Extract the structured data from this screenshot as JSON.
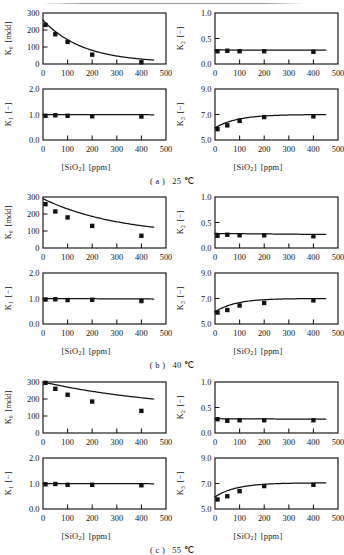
{
  "figure": {
    "xlabel_main": "[SiO",
    "xlabel_sub": "2",
    "xlabel_close": "]",
    "xlabel_unit": "[ppm]",
    "x_ticks": [
      "0",
      "100",
      "200",
      "300",
      "400",
      "500"
    ],
    "xlim": [
      0,
      500
    ],
    "marker_color": "#121212",
    "curve_color": "#121212",
    "axis_color": "#141414"
  },
  "sections": [
    {
      "id": "a",
      "caption_label": "( a )",
      "caption_value": "25 ℃",
      "panels": [
        {
          "position": "top-left",
          "y_symbol": "K",
          "y_subscript": "0",
          "y_unit": "[mdd]",
          "y_ticks": [
            "0",
            "100",
            "200",
            "300"
          ],
          "ylim": [
            0,
            300
          ],
          "points_x": [
            10,
            50,
            100,
            200,
            400
          ],
          "points_y": [
            230,
            175,
            130,
            55,
            10
          ],
          "curve_type": "exponential-decay",
          "curve_y0": 258,
          "curve_y_end": 8,
          "curve_k": 0.0062
        },
        {
          "position": "top-right",
          "y_symbol": "K",
          "y_subscript": "2",
          "y_unit": "[−]",
          "y_ticks": [
            "0.0",
            "0.5",
            "1.0"
          ],
          "ylim": [
            0,
            1
          ],
          "points_x": [
            10,
            50,
            100,
            200,
            400
          ],
          "points_y": [
            0.25,
            0.26,
            0.25,
            0.25,
            0.24
          ],
          "curve_type": "flat",
          "curve_y0": 0.275,
          "curve_y_end": 0.27,
          "curve_k": 0
        },
        {
          "position": "bottom-left",
          "y_symbol": "K",
          "y_subscript": "1",
          "y_unit": "[−]",
          "y_ticks": [
            "0.0",
            "1.0",
            "2.0"
          ],
          "ylim": [
            0,
            2
          ],
          "points_x": [
            10,
            50,
            100,
            200,
            400
          ],
          "points_y": [
            0.95,
            0.97,
            0.95,
            0.93,
            0.92
          ],
          "curve_type": "flat",
          "curve_y0": 1.0,
          "curve_y_end": 0.99,
          "curve_k": 0
        },
        {
          "position": "bottom-right",
          "y_symbol": "K",
          "y_subscript": "3",
          "y_unit": "[−]",
          "y_ticks": [
            "5.0",
            "7.0",
            "9.0"
          ],
          "ylim": [
            5,
            9
          ],
          "points_x": [
            10,
            50,
            100,
            200,
            400
          ],
          "points_y": [
            5.85,
            6.15,
            6.5,
            6.8,
            6.85
          ],
          "curve_type": "saturating-rise",
          "curve_y0": 5.95,
          "curve_y_end": 7.0,
          "curve_k": 0.011
        }
      ]
    },
    {
      "id": "b",
      "caption_label": "( b )",
      "caption_value": "40 ℃",
      "panels": [
        {
          "position": "top-left",
          "y_symbol": "K",
          "y_subscript": "0",
          "y_unit": "[mdd]",
          "y_ticks": [
            "0",
            "100",
            "200",
            "300"
          ],
          "ylim": [
            0,
            300
          ],
          "points_x": [
            10,
            50,
            100,
            200,
            400
          ],
          "points_y": [
            258,
            215,
            180,
            130,
            72
          ],
          "curve_type": "exponential-decay",
          "curve_y0": 290,
          "curve_y_end": 70,
          "curve_k": 0.0032
        },
        {
          "position": "top-right",
          "y_symbol": "K",
          "y_subscript": "2",
          "y_unit": "[−]",
          "y_ticks": [
            "0.0",
            "0.5",
            "1.0"
          ],
          "ylim": [
            0,
            1
          ],
          "points_x": [
            10,
            50,
            100,
            200,
            400
          ],
          "points_y": [
            0.24,
            0.26,
            0.25,
            0.25,
            0.23
          ],
          "curve_type": "flat",
          "curve_y0": 0.285,
          "curve_y_end": 0.265,
          "curve_k": 0
        },
        {
          "position": "bottom-left",
          "y_symbol": "K",
          "y_subscript": "1",
          "y_unit": "[−]",
          "y_ticks": [
            "0.0",
            "1.0",
            "2.0"
          ],
          "ylim": [
            0,
            2
          ],
          "points_x": [
            10,
            50,
            100,
            200,
            400
          ],
          "points_y": [
            0.96,
            0.97,
            0.94,
            0.95,
            0.9
          ],
          "curve_type": "flat",
          "curve_y0": 1.0,
          "curve_y_end": 0.98,
          "curve_k": 0
        },
        {
          "position": "bottom-right",
          "y_symbol": "K",
          "y_subscript": "3",
          "y_unit": "[−]",
          "y_ticks": [
            "5.0",
            "7.0",
            "9.0"
          ],
          "ylim": [
            5,
            9
          ],
          "points_x": [
            10,
            50,
            100,
            200,
            400
          ],
          "points_y": [
            5.9,
            6.1,
            6.45,
            6.65,
            6.85
          ],
          "curve_type": "saturating-rise",
          "curve_y0": 5.95,
          "curve_y_end": 7.0,
          "curve_k": 0.012
        }
      ]
    },
    {
      "id": "c",
      "caption_label": "( c )",
      "caption_value": "55 ℃",
      "panels": [
        {
          "position": "top-left",
          "y_symbol": "K",
          "y_subscript": "0",
          "y_unit": "[mdd]",
          "y_ticks": [
            "0",
            "100",
            "200",
            "300"
          ],
          "ylim": [
            0,
            300
          ],
          "points_x": [
            10,
            50,
            100,
            200,
            400
          ],
          "points_y": [
            295,
            260,
            225,
            185,
            130
          ],
          "curve_type": "exponential-decay",
          "curve_y0": 300,
          "curve_y_end": 126,
          "curve_k": 0.0019
        },
        {
          "position": "top-right",
          "y_symbol": "K",
          "y_subscript": "2",
          "y_unit": "[−]",
          "y_ticks": [
            "0.0",
            "0.5",
            "1.0"
          ],
          "ylim": [
            0,
            1
          ],
          "points_x": [
            10,
            50,
            100,
            200,
            400
          ],
          "points_y": [
            0.27,
            0.24,
            0.25,
            0.25,
            0.25
          ],
          "curve_type": "flat",
          "curve_y0": 0.28,
          "curve_y_end": 0.27,
          "curve_k": 0
        },
        {
          "position": "bottom-left",
          "y_symbol": "K",
          "y_subscript": "1",
          "y_unit": "[−]",
          "y_ticks": [
            "0.0",
            "1.0",
            "2.0"
          ],
          "ylim": [
            0,
            2
          ],
          "points_x": [
            10,
            50,
            100,
            200,
            400
          ],
          "points_y": [
            0.97,
            0.98,
            0.95,
            0.95,
            0.93
          ],
          "curve_type": "flat",
          "curve_y0": 1.0,
          "curve_y_end": 0.99,
          "curve_k": 0
        },
        {
          "position": "bottom-right",
          "y_symbol": "K",
          "y_subscript": "3",
          "y_unit": "[−]",
          "y_ticks": [
            "5.0",
            "7.0",
            "9.0"
          ],
          "ylim": [
            5,
            9
          ],
          "points_x": [
            10,
            50,
            100,
            200,
            400
          ],
          "points_y": [
            5.75,
            6.0,
            6.4,
            6.8,
            6.9
          ],
          "curve_type": "saturating-rise",
          "curve_y0": 5.95,
          "curve_y_end": 7.05,
          "curve_k": 0.0115
        }
      ]
    }
  ],
  "chart_data": {
    "type": "scatter",
    "title": "",
    "xlabel": "[SiO2] [ppm]",
    "xlim": [
      0,
      500
    ],
    "x_ticks": [
      0,
      100,
      200,
      300,
      400,
      500
    ],
    "grid": false,
    "legend": "none",
    "panels": [
      {
        "section": "( a ) 25 ℃",
        "ylabel": "K0 [mdd]",
        "ylim": [
          0,
          300
        ],
        "y_ticks": [
          0,
          100,
          200,
          300
        ],
        "x": [
          10,
          50,
          100,
          200,
          400
        ],
        "values": [
          230,
          175,
          130,
          55,
          10
        ],
        "fit": "exponential decay from 258 to 8"
      },
      {
        "section": "( a ) 25 ℃",
        "ylabel": "K2 [-]",
        "ylim": [
          0,
          1
        ],
        "y_ticks": [
          0.0,
          0.5,
          1.0
        ],
        "x": [
          10,
          50,
          100,
          200,
          400
        ],
        "values": [
          0.25,
          0.26,
          0.25,
          0.25,
          0.24
        ],
        "fit": "constant 0.27"
      },
      {
        "section": "( a ) 25 ℃",
        "ylabel": "K1 [-]",
        "ylim": [
          0,
          2
        ],
        "y_ticks": [
          0.0,
          1.0,
          2.0
        ],
        "x": [
          10,
          50,
          100,
          200,
          400
        ],
        "values": [
          0.95,
          0.97,
          0.95,
          0.93,
          0.92
        ],
        "fit": "constant 1.0"
      },
      {
        "section": "( a ) 25 ℃",
        "ylabel": "K3 [-]",
        "ylim": [
          5,
          9
        ],
        "y_ticks": [
          5.0,
          7.0,
          9.0
        ],
        "x": [
          10,
          50,
          100,
          200,
          400
        ],
        "values": [
          5.85,
          6.15,
          6.5,
          6.8,
          6.85
        ],
        "fit": "saturating rise from 5.95 to 7.0"
      },
      {
        "section": "( b ) 40 ℃",
        "ylabel": "K0 [mdd]",
        "ylim": [
          0,
          300
        ],
        "y_ticks": [
          0,
          100,
          200,
          300
        ],
        "x": [
          10,
          50,
          100,
          200,
          400
        ],
        "values": [
          258,
          215,
          180,
          130,
          72
        ],
        "fit": "exponential decay from 290 to 70"
      },
      {
        "section": "( b ) 40 ℃",
        "ylabel": "K2 [-]",
        "ylim": [
          0,
          1
        ],
        "y_ticks": [
          0.0,
          0.5,
          1.0
        ],
        "x": [
          10,
          50,
          100,
          200,
          400
        ],
        "values": [
          0.24,
          0.26,
          0.25,
          0.25,
          0.23
        ],
        "fit": "constant 0.27"
      },
      {
        "section": "( b ) 40 ℃",
        "ylabel": "K1 [-]",
        "ylim": [
          0,
          2
        ],
        "y_ticks": [
          0.0,
          1.0,
          2.0
        ],
        "x": [
          10,
          50,
          100,
          200,
          400
        ],
        "values": [
          0.96,
          0.97,
          0.94,
          0.95,
          0.9
        ],
        "fit": "constant 1.0"
      },
      {
        "section": "( b ) 40 ℃",
        "ylabel": "K3 [-]",
        "ylim": [
          5,
          9
        ],
        "y_ticks": [
          5.0,
          7.0,
          9.0
        ],
        "x": [
          10,
          50,
          100,
          200,
          400
        ],
        "values": [
          5.9,
          6.1,
          6.45,
          6.65,
          6.85
        ],
        "fit": "saturating rise from 5.95 to 7.0"
      },
      {
        "section": "( c ) 55 ℃",
        "ylabel": "K0 [mdd]",
        "ylim": [
          0,
          300
        ],
        "y_ticks": [
          0,
          100,
          200,
          300
        ],
        "x": [
          10,
          50,
          100,
          200,
          400
        ],
        "values": [
          295,
          260,
          225,
          185,
          130
        ],
        "fit": "exponential decay from 300 to 126"
      },
      {
        "section": "( c ) 55 ℃",
        "ylabel": "K2 [-]",
        "ylim": [
          0,
          1
        ],
        "y_ticks": [
          0.0,
          0.5,
          1.0
        ],
        "x": [
          10,
          50,
          100,
          200,
          400
        ],
        "values": [
          0.27,
          0.24,
          0.25,
          0.25,
          0.25
        ],
        "fit": "constant 0.27"
      },
      {
        "section": "( c ) 55 ℃",
        "ylabel": "K1 [-]",
        "ylim": [
          0,
          2
        ],
        "y_ticks": [
          0.0,
          1.0,
          2.0
        ],
        "x": [
          10,
          50,
          100,
          200,
          400
        ],
        "values": [
          0.97,
          0.98,
          0.95,
          0.95,
          0.93
        ],
        "fit": "constant 1.0"
      },
      {
        "section": "( c ) 55 ℃",
        "ylabel": "K3 [-]",
        "ylim": [
          5,
          9
        ],
        "y_ticks": [
          5.0,
          7.0,
          9.0
        ],
        "x": [
          10,
          50,
          100,
          200,
          400
        ],
        "values": [
          5.75,
          6.0,
          6.4,
          6.8,
          6.9
        ],
        "fit": "saturating rise from 5.95 to 7.05"
      }
    ]
  }
}
